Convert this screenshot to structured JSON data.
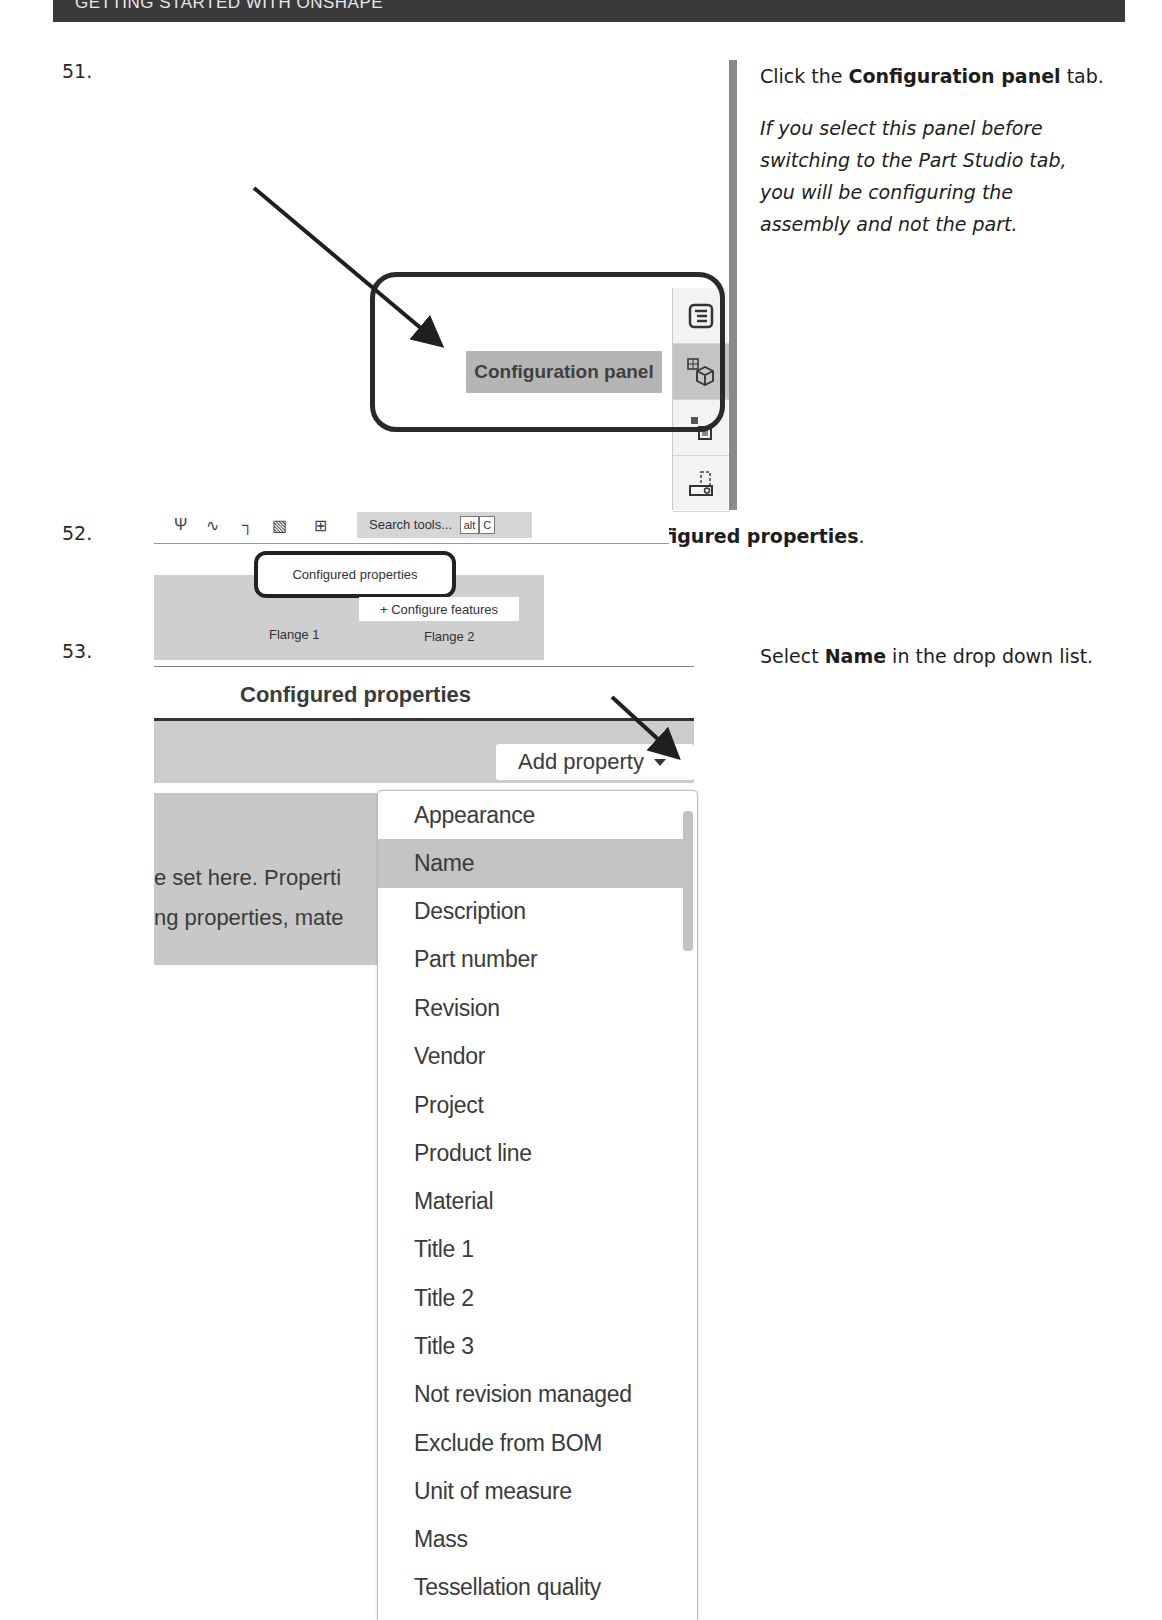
{
  "header": {
    "title": "GETTING STARTED WITH ONSHAPE"
  },
  "steps": [
    {
      "number": "51.",
      "instruction_pre": "Click the ",
      "instruction_bold": "Configuration panel",
      "instruction_post": " tab.",
      "note": "If you select this panel before switching to the Part Studio tab, you will be configuring the assembly and not the part.",
      "screenshot": {
        "tooltip": "Configuration panel",
        "icons": [
          "feature-list-icon",
          "configuration-panel-icon",
          "instances-icon",
          "mate-connector-icon"
        ]
      }
    },
    {
      "number": "52.",
      "instruction_pre": "Select ",
      "instruction_bold": "Configured properties",
      "instruction_post": ".",
      "screenshot": {
        "search_placeholder": "Search tools...",
        "shortcut_keys": [
          "alt",
          "C"
        ],
        "menu_item": "Configured properties",
        "configure_button": "+ Configure features",
        "tabs": [
          "Flange 1",
          "Flange 2"
        ]
      }
    },
    {
      "number": "53.",
      "instruction_pre": "Select ",
      "instruction_bold": "Name",
      "instruction_post": " in the drop down list.",
      "screenshot": {
        "panel_title": "Configured properties",
        "add_property_label": "Add property",
        "body_text_line1": "e set here. Properti",
        "body_text_line2": "ng properties, mate",
        "dropdown_selected": "Name",
        "dropdown_items": [
          "Appearance",
          "Name",
          "Description",
          "Part number",
          "Revision",
          "Vendor",
          "Project",
          "Product line",
          "Material",
          "Title 1",
          "Title 2",
          "Title 3",
          "Not revision managed",
          "Exclude from BOM",
          "Unit of measure",
          "Mass",
          "Tessellation quality"
        ]
      }
    }
  ],
  "colors": {
    "header_bg": "#3a3a3a",
    "divider": "#8a8a8a",
    "highlight": "#c3c3c3"
  }
}
